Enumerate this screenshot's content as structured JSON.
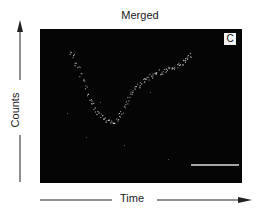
{
  "chart_data": {
    "type": "scatter",
    "title": "Merged",
    "panel_label": "C",
    "xlabel": "Time",
    "ylabel": "Counts",
    "grid": false,
    "legend": null,
    "background": "#050505",
    "point_color": "#e8e8e8",
    "scale_bar": true,
    "series": [
      {
        "name": "Counts",
        "x": [
          0,
          2,
          4,
          6,
          8,
          10,
          12,
          14,
          16,
          18,
          20,
          22,
          24,
          26,
          28,
          30,
          32,
          34,
          36,
          38,
          40,
          42,
          44,
          46,
          48,
          50,
          52,
          54,
          56,
          58,
          60,
          62,
          64,
          66,
          68,
          70,
          72,
          74,
          76,
          78,
          80,
          82,
          84,
          86,
          88,
          90,
          92,
          94,
          96,
          98,
          100
        ],
        "y": [
          92,
          88,
          82,
          78,
          72,
          66,
          60,
          54,
          50,
          45,
          40,
          37,
          35,
          33,
          31,
          30,
          29,
          28,
          30,
          32,
          35,
          38,
          42,
          46,
          50,
          54,
          57,
          60,
          62,
          64,
          66,
          68,
          69,
          70,
          71,
          72,
          73,
          74,
          74,
          75,
          76,
          77,
          77,
          78,
          79,
          80,
          82,
          84,
          86,
          88,
          89
        ]
      }
    ],
    "xlim": [
      0,
      100
    ],
    "ylim": [
      0,
      100
    ]
  },
  "labels": {
    "title": "Merged",
    "panel": "C",
    "x": "Time",
    "y": "Counts"
  }
}
